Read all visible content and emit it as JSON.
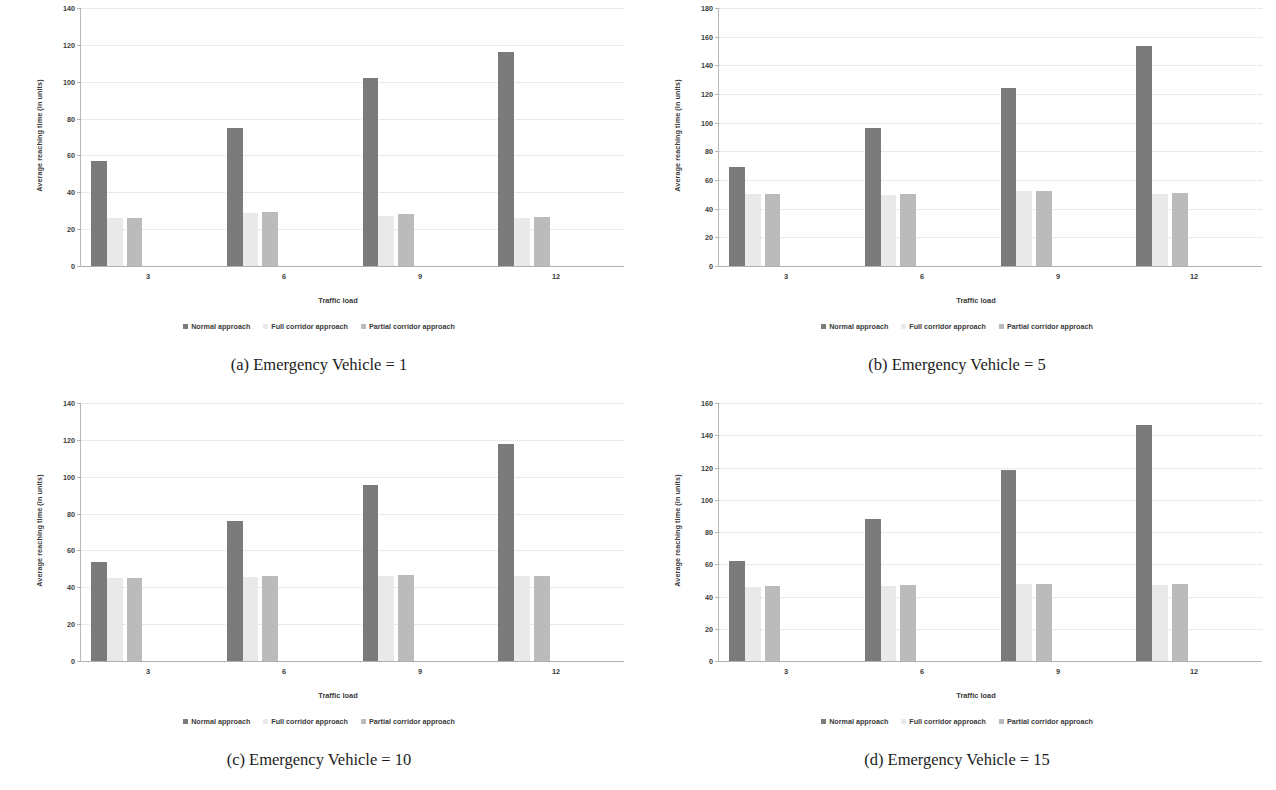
{
  "figure": {
    "panel_count": 4,
    "series_colors": {
      "normal": "#7b7b7b",
      "full": "#e9e9e9",
      "partial": "#bbbbbb"
    },
    "legend": [
      {
        "label": "Normal approach",
        "swatch": "legend-swatch-normal"
      },
      {
        "label": "Full corridor approach",
        "swatch": "legend-swatch-full"
      },
      {
        "label": "Partial corridor approach",
        "swatch": "legend-swatch-partial"
      }
    ],
    "axis": {
      "xlabel": "Traffic load",
      "ylabel": "Average reaching time (in units)"
    }
  },
  "chart_data": [
    {
      "type": "bar",
      "panel": "a",
      "caption": "(a) Emergency Vehicle = 1",
      "title": "",
      "xlabel": "Traffic load",
      "ylabel": "Average reaching time (in units)",
      "categories": [
        "3",
        "6",
        "9",
        "12"
      ],
      "yticks": [
        0,
        20,
        40,
        60,
        80,
        100,
        120,
        140
      ],
      "ylim": [
        0,
        140
      ],
      "grid": true,
      "legend_position": "bottom",
      "series": [
        {
          "name": "Normal approach",
          "values": [
            57,
            75,
            102,
            116
          ]
        },
        {
          "name": "Full corridor approach",
          "values": [
            26,
            29,
            27,
            26
          ]
        },
        {
          "name": "Partial corridor approach",
          "values": [
            26,
            29.5,
            28,
            26.5
          ]
        }
      ]
    },
    {
      "type": "bar",
      "panel": "b",
      "caption": "(b) Emergency Vehicle = 5",
      "title": "",
      "xlabel": "Traffic load",
      "ylabel": "Average reaching time (in units)",
      "categories": [
        "3",
        "6",
        "9",
        "12"
      ],
      "yticks": [
        0,
        20,
        40,
        60,
        80,
        100,
        120,
        140,
        160,
        180
      ],
      "ylim": [
        0,
        180
      ],
      "grid": true,
      "legend_position": "bottom",
      "series": [
        {
          "name": "Normal approach",
          "values": [
            69,
            96,
            124.5,
            153.5
          ]
        },
        {
          "name": "Full corridor approach",
          "values": [
            50,
            49.5,
            52,
            50.5
          ]
        },
        {
          "name": "Partial corridor approach",
          "values": [
            50,
            50,
            52.5,
            51
          ]
        }
      ]
    },
    {
      "type": "bar",
      "panel": "c",
      "caption": "(c) Emergency Vehicle = 10",
      "title": "",
      "xlabel": "Traffic load",
      "ylabel": "Average reaching time (in units)",
      "categories": [
        "3",
        "6",
        "9",
        "12"
      ],
      "yticks": [
        0,
        20,
        40,
        60,
        80,
        100,
        120,
        140
      ],
      "ylim": [
        0,
        140
      ],
      "grid": true,
      "legend_position": "bottom",
      "series": [
        {
          "name": "Normal approach",
          "values": [
            53.5,
            76,
            95.5,
            118
          ]
        },
        {
          "name": "Full corridor approach",
          "values": [
            45,
            45.5,
            46,
            46
          ]
        },
        {
          "name": "Partial corridor approach",
          "values": [
            45,
            46,
            46.5,
            46
          ]
        }
      ]
    },
    {
      "type": "bar",
      "panel": "d",
      "caption": "(d) Emergency Vehicle = 15",
      "title": "",
      "xlabel": "Traffic load",
      "ylabel": "Average reaching time (in units)",
      "categories": [
        "3",
        "6",
        "9",
        "12"
      ],
      "yticks": [
        0,
        20,
        40,
        60,
        80,
        100,
        120,
        140,
        160
      ],
      "ylim": [
        0,
        160
      ],
      "grid": true,
      "legend_position": "bottom",
      "series": [
        {
          "name": "Normal approach",
          "values": [
            62,
            88,
            118.5,
            146.5
          ]
        },
        {
          "name": "Full corridor approach",
          "values": [
            46,
            46.5,
            47.5,
            47
          ]
        },
        {
          "name": "Partial corridor approach",
          "values": [
            46.5,
            47,
            48,
            47.5
          ]
        }
      ]
    }
  ]
}
